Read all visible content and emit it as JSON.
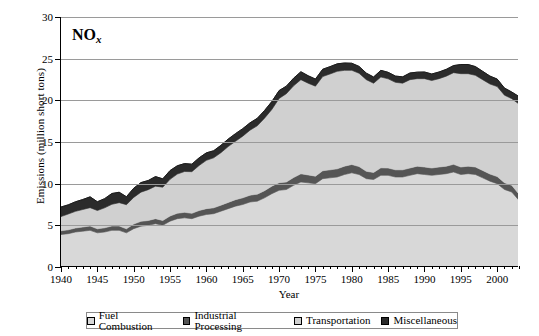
{
  "chart_data": {
    "type": "area",
    "stacked": true,
    "title": "NOx",
    "title_base": "NO",
    "title_sub": "x",
    "xlabel": "Year",
    "ylabel": "Emissions (million short tons)",
    "xlim": [
      1940,
      2003
    ],
    "ylim": [
      0,
      30
    ],
    "yticks": [
      0,
      5,
      10,
      15,
      20,
      25,
      30
    ],
    "xticks_major": [
      1940,
      1945,
      1950,
      1955,
      1960,
      1965,
      1970,
      1975,
      1980,
      1985,
      1990,
      1995,
      2000
    ],
    "xtick_interval_minor": 1,
    "grid": true,
    "legend_position": "bottom",
    "colors": {
      "fuel_combustion": "#d8d8d8",
      "industrial_processing": "#555555",
      "transportation": "#d0d0d0",
      "miscellaneous": "#2b2b2b",
      "gridline": "#9a9a9a",
      "axis": "#000000"
    },
    "x": [
      1940,
      1941,
      1942,
      1943,
      1944,
      1945,
      1946,
      1947,
      1948,
      1949,
      1950,
      1951,
      1952,
      1953,
      1954,
      1955,
      1956,
      1957,
      1958,
      1959,
      1960,
      1961,
      1962,
      1963,
      1964,
      1965,
      1966,
      1967,
      1968,
      1969,
      1970,
      1971,
      1972,
      1973,
      1974,
      1975,
      1976,
      1977,
      1978,
      1979,
      1980,
      1981,
      1982,
      1983,
      1984,
      1985,
      1986,
      1987,
      1988,
      1989,
      1990,
      1991,
      1992,
      1993,
      1994,
      1995,
      1996,
      1997,
      1998,
      1999,
      2000,
      2001,
      2002,
      2003
    ],
    "series": [
      {
        "name": "Fuel Combustion",
        "color": "#d8d8d8",
        "values": [
          3.9,
          4.0,
          4.2,
          4.3,
          4.4,
          4.1,
          4.2,
          4.4,
          4.4,
          4.1,
          4.6,
          4.9,
          5.0,
          5.2,
          5.0,
          5.5,
          5.8,
          5.9,
          5.8,
          6.1,
          6.3,
          6.4,
          6.7,
          7.0,
          7.3,
          7.5,
          7.8,
          7.9,
          8.3,
          8.8,
          9.2,
          9.3,
          9.8,
          10.2,
          10.1,
          10.0,
          10.6,
          10.7,
          10.8,
          11.1,
          11.3,
          11.1,
          10.6,
          10.5,
          11.0,
          11.0,
          10.8,
          10.8,
          11.0,
          11.2,
          11.1,
          11.0,
          11.1,
          11.2,
          11.4,
          11.1,
          11.2,
          11.1,
          10.7,
          10.3,
          10.0,
          9.3,
          9.0,
          8.0
        ]
      },
      {
        "name": "Industrial Processing",
        "color": "#555555",
        "values": [
          0.45,
          0.46,
          0.48,
          0.5,
          0.52,
          0.48,
          0.5,
          0.52,
          0.52,
          0.48,
          0.55,
          0.58,
          0.58,
          0.6,
          0.58,
          0.62,
          0.65,
          0.66,
          0.64,
          0.68,
          0.7,
          0.7,
          0.72,
          0.75,
          0.78,
          0.8,
          0.82,
          0.84,
          0.86,
          0.9,
          0.92,
          0.9,
          0.94,
          0.98,
          0.95,
          0.9,
          0.95,
          0.96,
          0.98,
          1.0,
          1.0,
          0.95,
          0.88,
          0.85,
          0.9,
          0.88,
          0.86,
          0.86,
          0.88,
          0.9,
          0.9,
          0.88,
          0.9,
          0.9,
          0.92,
          0.9,
          0.9,
          0.9,
          0.88,
          0.86,
          0.85,
          0.82,
          0.8,
          0.75
        ]
      },
      {
        "name": "Transportation",
        "color": "#d0d0d0",
        "values": [
          1.7,
          1.9,
          2.0,
          2.1,
          2.2,
          2.2,
          2.4,
          2.6,
          2.8,
          2.9,
          3.2,
          3.5,
          3.7,
          3.9,
          4.0,
          4.4,
          4.7,
          4.9,
          5.0,
          5.4,
          5.8,
          6.0,
          6.3,
          6.7,
          7.0,
          7.4,
          7.8,
          8.2,
          8.7,
          9.2,
          10.1,
          10.6,
          11.0,
          11.3,
          11.0,
          10.8,
          11.3,
          11.5,
          11.7,
          11.5,
          11.3,
          11.2,
          11.0,
          10.7,
          10.9,
          10.7,
          10.5,
          10.4,
          10.6,
          10.5,
          10.6,
          10.5,
          10.6,
          10.8,
          11.0,
          11.2,
          11.1,
          11.0,
          10.9,
          10.8,
          10.8,
          10.5,
          10.4,
          10.8
        ]
      },
      {
        "name": "Miscellaneous",
        "color": "#2b2b2b",
        "values": [
          1.15,
          1.1,
          1.15,
          1.2,
          1.3,
          1.05,
          1.1,
          1.3,
          1.25,
          0.95,
          1.1,
          1.15,
          1.1,
          1.15,
          1.0,
          1.05,
          1.0,
          0.95,
          0.9,
          0.92,
          0.9,
          0.85,
          0.88,
          0.9,
          0.92,
          0.9,
          0.88,
          0.9,
          0.92,
          0.95,
          0.95,
          0.9,
          0.92,
          0.95,
          0.9,
          0.85,
          0.88,
          0.88,
          0.9,
          0.88,
          0.85,
          0.82,
          0.78,
          0.75,
          0.8,
          0.78,
          0.75,
          0.76,
          0.8,
          0.78,
          0.8,
          0.78,
          0.8,
          0.82,
          0.85,
          1.1,
          1.1,
          1.05,
          1.0,
          0.95,
          0.9,
          0.85,
          0.8,
          0.9
        ]
      }
    ]
  },
  "legend": {
    "items": [
      {
        "label": "Fuel Combustion",
        "swatch": "#d8d8d8"
      },
      {
        "label": "Industrial Processing",
        "swatch": "#555555"
      },
      {
        "label": "Transportation",
        "swatch": "#d0d0d0"
      },
      {
        "label": "Miscellaneous",
        "swatch": "#2b2b2b"
      }
    ]
  }
}
